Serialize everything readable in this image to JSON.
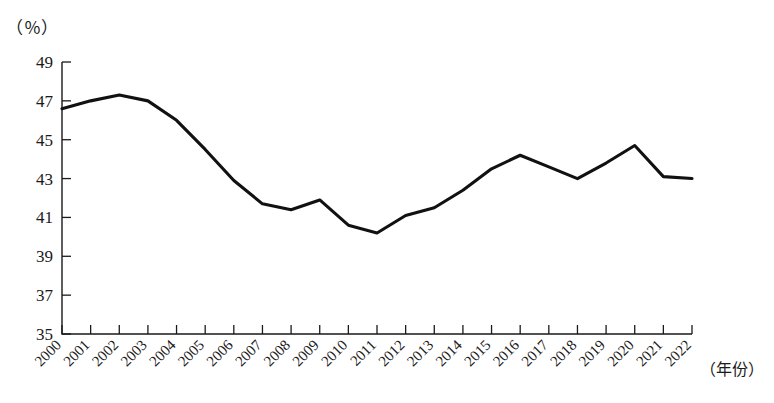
{
  "chart_data": {
    "type": "line",
    "title": "",
    "subtitle": "",
    "xlabel": "（年份）",
    "ylabel": "（％）",
    "unit_label": "（％）",
    "categories": [
      "2000",
      "2001",
      "2002",
      "2003",
      "2004",
      "2005",
      "2006",
      "2007",
      "2008",
      "2009",
      "2010",
      "2011",
      "2012",
      "2013",
      "2014",
      "2015",
      "2016",
      "2017",
      "2018",
      "2019",
      "2020",
      "2021",
      "2022"
    ],
    "values": [
      46.6,
      47.0,
      47.3,
      47.0,
      46.0,
      44.5,
      42.9,
      41.7,
      41.4,
      41.9,
      40.6,
      40.2,
      41.1,
      41.5,
      42.4,
      43.5,
      44.2,
      43.6,
      43.0,
      43.8,
      44.7,
      43.1,
      43.0
    ],
    "series": [
      {
        "name": "",
        "color": "#111111",
        "values": [
          46.6,
          47.0,
          47.3,
          47.0,
          46.0,
          44.5,
          42.9,
          41.7,
          41.4,
          41.9,
          40.6,
          40.2,
          41.1,
          41.5,
          42.4,
          43.5,
          44.2,
          43.6,
          43.0,
          43.8,
          44.7,
          43.1,
          43.0
        ]
      }
    ],
    "ylim": [
      35,
      49
    ],
    "yticks": [
      35,
      37,
      39,
      41,
      43,
      45,
      47,
      49
    ],
    "ytick_labels": [
      "35",
      "37",
      "39",
      "41",
      "43",
      "45",
      "47",
      "49"
    ],
    "xtick_labels": [
      "2000",
      "2001",
      "2002",
      "2003",
      "2004",
      "2005",
      "2006",
      "2007",
      "2008",
      "2009",
      "2010",
      "2011",
      "2012",
      "2013",
      "2014",
      "2015",
      "2016",
      "2017",
      "2018",
      "2019",
      "2020",
      "2021",
      "2022"
    ],
    "grid": false,
    "legend": false,
    "legend_position": "none",
    "line_color": "#111111",
    "axis_color": "#1a1a1a",
    "background_color": "#ffffff"
  }
}
